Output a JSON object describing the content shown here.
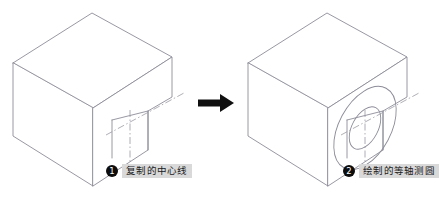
{
  "figure": {
    "background_color": "#ffffff",
    "line_color": "#8c8c99",
    "centerline_color": "#9a9aa3",
    "badge_color": "#0d0d0d",
    "label_band_color": "#d9d9d9",
    "arrow_color": "#101010"
  },
  "panels": [
    {
      "id": "before",
      "callout": {
        "number": "1",
        "badge_glyph": "❶",
        "text": "复制的中心线"
      },
      "shape": {
        "name": "isometric-block-with-notch",
        "features": [
          "notch-step",
          "centerline-cross"
        ]
      }
    },
    {
      "id": "after",
      "callout": {
        "number": "2",
        "badge_glyph": "❷",
        "text": "绘制的等轴测圆"
      },
      "shape": {
        "name": "isometric-block-with-notch",
        "features": [
          "notch-step",
          "centerline-cross",
          "isometric-ellipse-outer",
          "isometric-ellipse-inner"
        ]
      }
    }
  ],
  "arrow": {
    "name": "right-arrow",
    "direction": "right"
  }
}
